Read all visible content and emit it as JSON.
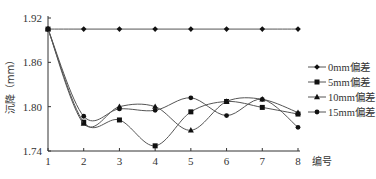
{
  "chart_data": {
    "type": "line",
    "title": "",
    "xlabel": "编号",
    "ylabel": "沉降（mm）",
    "x": [
      1,
      2,
      3,
      4,
      5,
      6,
      7,
      8
    ],
    "xticks": [
      "1",
      "2",
      "3",
      "4",
      "5",
      "6",
      "7",
      "8"
    ],
    "ylim": [
      1.74,
      1.92
    ],
    "yticks": [
      "1.74",
      "1.80",
      "1.86",
      "1.92"
    ],
    "yticks_values": [
      1.74,
      1.8,
      1.86,
      1.92
    ],
    "grid": false,
    "smooth": true,
    "legend_position": "right",
    "series": [
      {
        "name": "0mm偏差",
        "marker": "diamond",
        "values": [
          1.905,
          1.905,
          1.905,
          1.905,
          1.905,
          1.905,
          1.905,
          1.905
        ]
      },
      {
        "name": "5mm偏差",
        "marker": "square",
        "values": [
          1.905,
          1.779,
          1.782,
          1.747,
          1.793,
          1.807,
          1.799,
          1.79
        ]
      },
      {
        "name": "10mm偏差",
        "marker": "triangle",
        "values": [
          1.905,
          1.777,
          1.8,
          1.8,
          1.768,
          1.807,
          1.81,
          1.792
        ]
      },
      {
        "name": "15mm偏差",
        "marker": "circle",
        "values": [
          1.905,
          1.787,
          1.797,
          1.795,
          1.812,
          1.788,
          1.81,
          1.772
        ]
      }
    ]
  }
}
